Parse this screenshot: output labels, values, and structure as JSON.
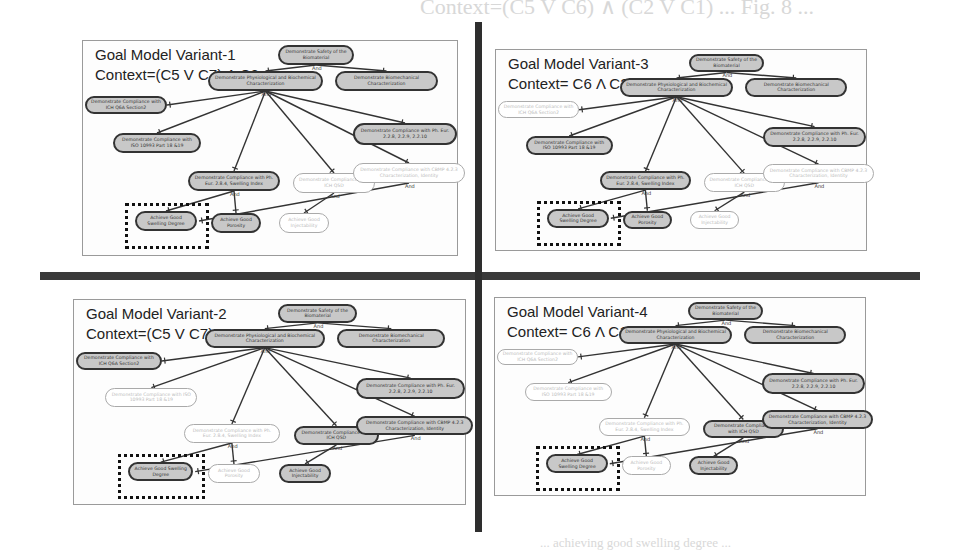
{
  "background_text": [
    "Context=(C5 V C6) ∧ (C2 V C1) ... Fig. 8 ...",
    "... variant of the biomaterial goal model ...",
    "... achieving good swelling degree ..."
  ],
  "panels": [
    {
      "title": "Goal Model Variant-1",
      "context": "Context=(C5 V C7) Λ C2",
      "nodes": {
        "root": {
          "label": "Demonstrate Safety of the Biomaterial",
          "active": true
        },
        "physio": {
          "label": "Demonstrate Physiological and Biochemical Characterization",
          "active": true
        },
        "biomech": {
          "label": "Demonstrate Biomechanical Characterization",
          "active": true
        },
        "ich_q6a": {
          "label": "Demonstrate Compliance with ICH Q6A Section2",
          "active": true
        },
        "iso": {
          "label": "Demonstrate Compliance with ISO 10993 Part 18 &19",
          "active": true
        },
        "ph_eur": {
          "label": "Demonstrate Compliance with Ph. Eur. 2.2.8, 2.2.9, 2.2.10",
          "active": true
        },
        "swelling_index": {
          "label": "Demonstrate Compliance with Ph. Eur. 2.8.4, Swelling Index",
          "active": true
        },
        "ich_q5d": {
          "label": "Demonstrate Compliance with ICH Q5D",
          "active": false
        },
        "cbmp": {
          "label": "Demonstrate Compliance with CBMP 4.2.3 Characterization, Identity",
          "active": false
        },
        "swelling_degree": {
          "label": "Achieve Good Swelling Degree",
          "active": true
        },
        "porosity": {
          "label": "Achieve Good Porosity",
          "active": true
        },
        "injectability": {
          "label": "Achieve Good Injectability",
          "active": false
        }
      }
    },
    {
      "title": "Goal Model Variant-2",
      "context": "Context=(C5 V C7) Λ C1",
      "nodes": {
        "root": {
          "label": "Demonstrate Safety of the Biomaterial",
          "active": true
        },
        "physio": {
          "label": "Demonstrate Physiological and Biochemical Characterization",
          "active": true
        },
        "biomech": {
          "label": "Demonstrate Biomechanical Characterization",
          "active": true
        },
        "ich_q6a": {
          "label": "Demonstrate Compliance with ICH Q6A Section2",
          "active": true
        },
        "iso": {
          "label": "Demonstrate Compliance with ISO 10993 Part 18 &19",
          "active": false
        },
        "ph_eur": {
          "label": "Demonstrate Compliance with Ph. Eur. 2.2.8, 2.2.9, 2.2.10",
          "active": true
        },
        "swelling_index": {
          "label": "Demonstrate Compliance with Ph. Eur. 2.8.4, Swelling Index",
          "active": false
        },
        "ich_q5d": {
          "label": "Demonstrate Compliance with ICH Q5D",
          "active": true
        },
        "cbmp": {
          "label": "Demonstrate Compliance with CBMP 4.2.3 Characterization, Identity",
          "active": true
        },
        "swelling_degree": {
          "label": "Achieve Good Swelling Degree",
          "active": true
        },
        "porosity": {
          "label": "Achieve Good Porosity",
          "active": false
        },
        "injectability": {
          "label": "Achieve Good Injectability",
          "active": true
        }
      }
    },
    {
      "title": "Goal Model Variant-3",
      "context": "Context= C6 Λ C2",
      "nodes": {
        "root": {
          "label": "Demonstrate Safety of the Biomaterial",
          "active": true
        },
        "physio": {
          "label": "Demonstrate Physiological and Biochemical Characterization",
          "active": true
        },
        "biomech": {
          "label": "Demonstrate Biomechanical Characterization",
          "active": true
        },
        "ich_q6a": {
          "label": "Demonstrate Compliance with ICH Q6A Section2",
          "active": false
        },
        "iso": {
          "label": "Demonstrate Compliance with ISO 10993 Part 18 &19",
          "active": true
        },
        "ph_eur": {
          "label": "Demonstrate Compliance with Ph. Eur. 2.2.8, 2.2.9, 2.2.10",
          "active": true
        },
        "swelling_index": {
          "label": "Demonstrate Compliance with Ph. Eur. 2.8.4, Swelling Index",
          "active": true
        },
        "ich_q5d": {
          "label": "Demonstrate Compliance with ICH Q5D",
          "active": false
        },
        "cbmp": {
          "label": "Demonstrate Compliance with CBMP 4.2.3 Characterization, Identity",
          "active": false
        },
        "swelling_degree": {
          "label": "Achieve Good Swelling Degree",
          "active": true
        },
        "porosity": {
          "label": "Achieve Good Porosity",
          "active": true
        },
        "injectability": {
          "label": "Achieve Good Injectability",
          "active": false
        }
      }
    },
    {
      "title": "Goal Model Variant-4",
      "context": "Context= C6 Λ C1",
      "nodes": {
        "root": {
          "label": "Demonstrate Safety of the Biomaterial",
          "active": true
        },
        "physio": {
          "label": "Demonstrate Physiological and Biochemical Characterization",
          "active": true
        },
        "biomech": {
          "label": "Demonstrate Biomechanical Characterization",
          "active": true
        },
        "ich_q6a": {
          "label": "Demonstrate Compliance with ICH Q6A Section2",
          "active": false
        },
        "iso": {
          "label": "Demonstrate Compliance with ISO 10993 Part 18 &19",
          "active": false
        },
        "ph_eur": {
          "label": "Demonstrate Compliance with Ph. Eur. 2.2.8, 2.2.9, 2.2.10",
          "active": true
        },
        "swelling_index": {
          "label": "Demonstrate Compliance with Ph. Eur. 2.8.4, Swelling Index",
          "active": false
        },
        "ich_q5d": {
          "label": "Demonstrate Compliance with ICH Q5D",
          "active": true
        },
        "cbmp": {
          "label": "Demonstrate Compliance with CBMP 4.2.3 Characterization, Identity",
          "active": true
        },
        "swelling_degree": {
          "label": "Achieve Good Swelling Degree",
          "active": true
        },
        "porosity": {
          "label": "Achieve Good Porosity",
          "active": false
        },
        "injectability": {
          "label": "Achieve Good Injectability",
          "active": true
        }
      }
    }
  ],
  "and_label": "And",
  "highlighted_goal": "swelling_degree"
}
